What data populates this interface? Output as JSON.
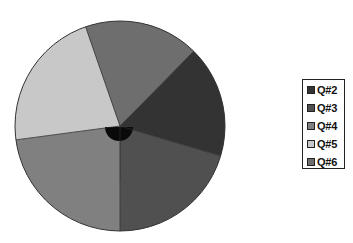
{
  "chart_data": {
    "type": "pie",
    "title": "",
    "categories": [
      "Q#2",
      "Q#3",
      "Q#4",
      "Q#5",
      "Q#6"
    ],
    "values": [
      17.2,
      20.4,
      22.9,
      21.8,
      17.7
    ],
    "colors": [
      "#333333",
      "#505050",
      "#808080",
      "#c8c8c8",
      "#6e6e6e"
    ],
    "start_angle_deg_clockwise_from_north": 44.6,
    "legend_position": "right",
    "grid": false
  },
  "legend": {
    "items": [
      {
        "label": "Q#2",
        "color": "#333333"
      },
      {
        "label": "Q#3",
        "color": "#505050"
      },
      {
        "label": "Q#4",
        "color": "#808080"
      },
      {
        "label": "Q#5",
        "color": "#c8c8c8"
      },
      {
        "label": "Q#6",
        "color": "#6e6e6e"
      }
    ]
  }
}
